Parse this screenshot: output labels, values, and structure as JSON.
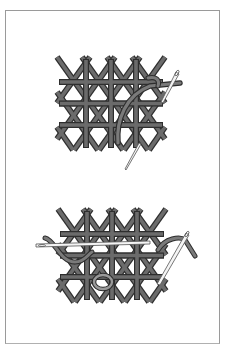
{
  "figure": {
    "type": "needlework-diagram",
    "panels": [
      {
        "id": "top",
        "description": "Lattice of crossed stitches with needle drawing thread through on the right",
        "grid": {
          "x": 61,
          "y": 60,
          "width": 100,
          "height": 85,
          "cols": 4,
          "rows": 4
        },
        "needle_count": 1
      },
      {
        "id": "bottom",
        "description": "Lattice of crossed stitches with threaded needles woven horizontally and on the right",
        "grid": {
          "x": 62,
          "y": 213,
          "width": 100,
          "height": 85,
          "cols": 4,
          "rows": 4
        },
        "needle_count": 2
      }
    ]
  },
  "colors": {
    "background": "#ffffff",
    "frame": "#9a9a9a",
    "bar_fill": "#6b6b6b",
    "bar_outline": "#2e2e2e",
    "needle_fill": "#f4f4f4",
    "needle_outline": "#555555"
  }
}
